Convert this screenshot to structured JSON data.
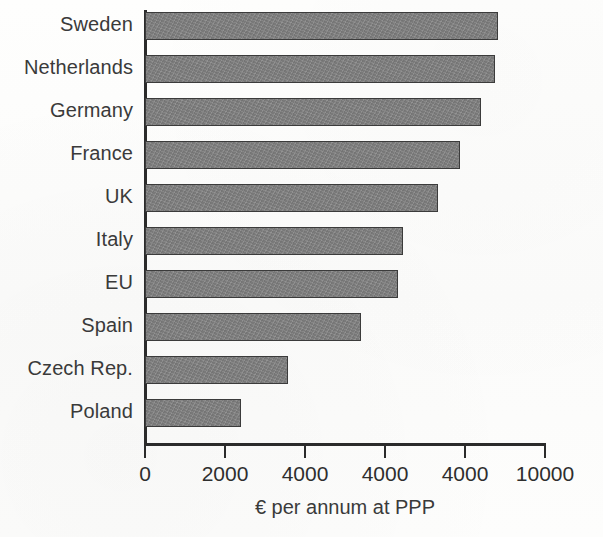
{
  "chart_data": {
    "type": "bar",
    "orientation": "horizontal",
    "title": "",
    "subtitle": "",
    "xlabel": "€ per annum at PPP",
    "ylabel": "",
    "xlim": [
      0,
      10000
    ],
    "grid": false,
    "legend": null,
    "bar_color": "#7e7e7e",
    "bar_border_color": "#3b3b3b",
    "axis_color": "#2b2b2b",
    "categories": [
      "Sweden",
      "Netherlands",
      "Germany",
      "France",
      "UK",
      "Italy",
      "EU",
      "Spain",
      "Czech Rep.",
      "Poland"
    ],
    "values": [
      8820,
      8750,
      8400,
      7880,
      7330,
      6450,
      6320,
      5400,
      3580,
      2400
    ],
    "x_tick_positions": [
      0,
      2000,
      4000,
      6000,
      8000,
      10000
    ],
    "x_tick_labels": [
      "0",
      "2000",
      "4000",
      "4000",
      "4000",
      "10000"
    ]
  }
}
